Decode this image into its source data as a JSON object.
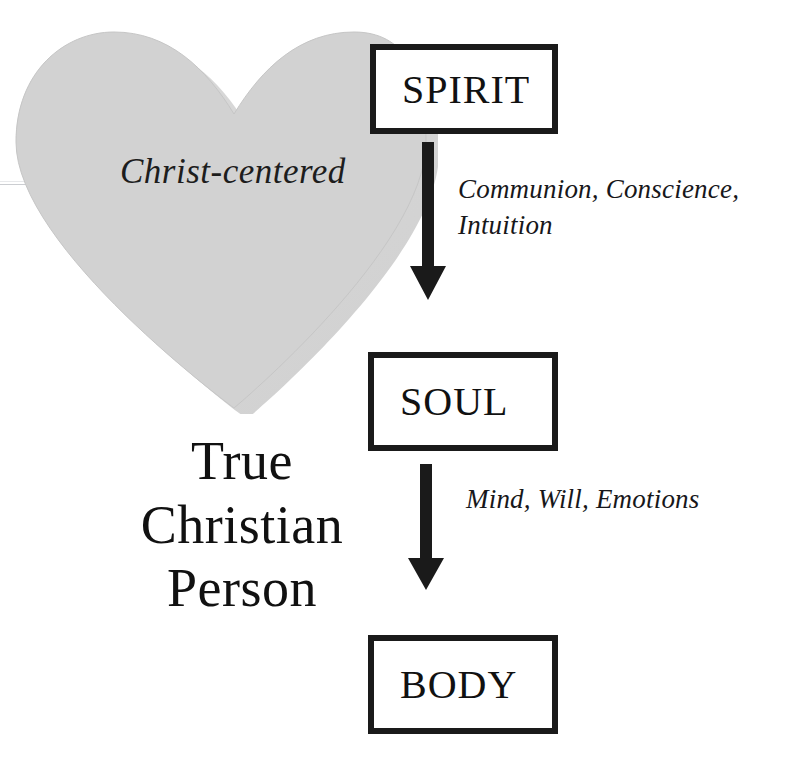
{
  "diagram": {
    "title_block": {
      "lines": [
        "True",
        "Christian",
        "Person"
      ]
    },
    "heart": {
      "label": "Christ-centered",
      "fill_color": "#d2d2d2",
      "shadow_color": "#b0b0b0",
      "icon": "heart-shape"
    },
    "boxes": [
      {
        "id": "spirit",
        "label": "SPIRIT"
      },
      {
        "id": "soul",
        "label": "SOUL"
      },
      {
        "id": "body",
        "label": "BODY"
      }
    ],
    "arrows": [
      {
        "id": "spirit-to-soul",
        "icon": "down-arrow",
        "color": "#1a1a1a"
      },
      {
        "id": "soul-to-body",
        "icon": "down-arrow",
        "color": "#1a1a1a"
      }
    ],
    "annotations": [
      {
        "id": "spirit-faculties",
        "text": "Communion, Conscience,\nIntuition"
      },
      {
        "id": "soul-faculties",
        "text": "Mind, Will, Emotions"
      }
    ],
    "colors": {
      "ink": "#111111",
      "box_border": "#1a1a1a",
      "heart_fill": "#d2d2d2",
      "background": "#ffffff"
    }
  }
}
